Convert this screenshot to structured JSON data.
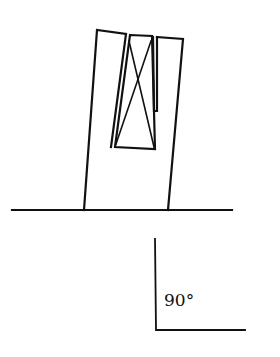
{
  "diagram": {
    "stroke_color": "#111111",
    "background": "#ffffff",
    "angle_marker": {
      "label": "90°"
    }
  }
}
